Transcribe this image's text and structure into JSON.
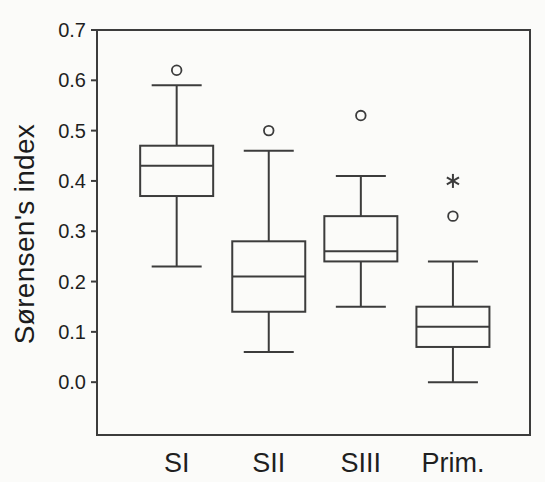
{
  "figure": {
    "background_color": "#fbfbf9",
    "line_color": "#3c3c3c",
    "text_color": "#1f1f1f"
  },
  "chart_data": {
    "type": "boxplot",
    "title": "",
    "xlabel": "",
    "ylabel": "Sørensen's index",
    "categories": [
      "SI",
      "SII",
      "SIII",
      "Prim."
    ],
    "ylim": [
      -0.105,
      0.7
    ],
    "yticks": [
      0.0,
      0.1,
      0.2,
      0.3,
      0.4,
      0.5,
      0.6,
      0.7
    ],
    "grid": false,
    "legend": "none",
    "symbols": {
      "outlier": "open-circle",
      "extreme": "asterisk"
    },
    "boxes": [
      {
        "category": "SI",
        "whisker_low": 0.23,
        "q1": 0.37,
        "median": 0.43,
        "q3": 0.47,
        "whisker_high": 0.59,
        "outliers": [
          0.62
        ],
        "extremes": []
      },
      {
        "category": "SII",
        "whisker_low": 0.06,
        "q1": 0.14,
        "median": 0.21,
        "q3": 0.28,
        "whisker_high": 0.46,
        "outliers": [
          0.5
        ],
        "extremes": []
      },
      {
        "category": "SIII",
        "whisker_low": 0.15,
        "q1": 0.24,
        "median": 0.26,
        "q3": 0.33,
        "whisker_high": 0.41,
        "outliers": [
          0.53
        ],
        "extremes": []
      },
      {
        "category": "Prim.",
        "whisker_low": 0.0,
        "q1": 0.07,
        "median": 0.11,
        "q3": 0.15,
        "whisker_high": 0.24,
        "outliers": [
          0.33
        ],
        "extremes": [
          0.4
        ]
      }
    ]
  }
}
